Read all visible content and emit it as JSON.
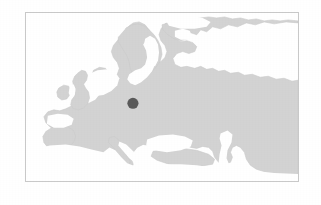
{
  "figure": {
    "kind": "locator-map",
    "region_name": "Europe",
    "projection_note": "",
    "caption": ""
  },
  "frame": {
    "x": 25,
    "y": 12,
    "width": 274,
    "height": 170,
    "border_color": "#c9c9c9",
    "border_width_px": 1
  },
  "colors": {
    "page_background": "#ffffff",
    "water": "#ffffff",
    "land": "#d3d3d3",
    "land_edge": "#cbcbcb",
    "marker": "#5a5a5a",
    "frame_border": "#c9c9c9"
  },
  "markers": [
    {
      "id": "location-marker",
      "label": "",
      "shape": "circle",
      "color": "#5a5a5a",
      "radius_px": 5.6,
      "x_px": 133,
      "y_px": 104,
      "frame_rel_x_pct": 39.6,
      "frame_rel_y_pct": 54.4
    }
  ],
  "geography": {
    "landmasses": [
      "Continental Europe",
      "Scandinavia",
      "Great Britain",
      "Ireland",
      "Iberian Peninsula",
      "Italian Peninsula",
      "Western Russia",
      "North Africa coast",
      "Anatolia"
    ],
    "water_bodies": [
      "Atlantic Ocean",
      "North Sea",
      "Norwegian Sea",
      "Baltic Sea",
      "Gulf of Bothnia",
      "Mediterranean Sea",
      "Black Sea",
      "Caspian Sea",
      "Barents Sea",
      "White Sea"
    ]
  },
  "chart_data": {
    "type": "map",
    "title": "",
    "subtitle": "",
    "xlabel": "",
    "ylabel": "",
    "grid": false,
    "legend": "none",
    "extent_note": "Europe and western Russia; Atlantic at left, Caspian Sea at right, North Africa at bottom, Arctic coast at top",
    "points": [
      {
        "name": "",
        "x": 39.6,
        "y": 54.4,
        "value": 1
      }
    ]
  }
}
